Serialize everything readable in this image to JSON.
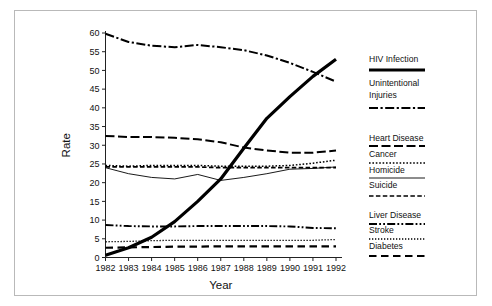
{
  "chart_data": {
    "type": "line",
    "title": "",
    "xlabel": "Year",
    "ylabel": "Rate",
    "x": [
      1982,
      1983,
      1984,
      1985,
      1986,
      1987,
      1988,
      1989,
      1990,
      1991,
      1992
    ],
    "categories": [
      "1982",
      "1983",
      "1984",
      "1985",
      "1986",
      "1987",
      "1988",
      "1989",
      "1990",
      "1991",
      "1992"
    ],
    "xlim": [
      1982,
      1992
    ],
    "ylim": [
      0,
      60
    ],
    "yticks": [
      0,
      5,
      10,
      15,
      20,
      25,
      30,
      35,
      40,
      45,
      50,
      55,
      60
    ],
    "ytick_labels": [
      "0",
      "5",
      "10",
      "15",
      "20",
      "25",
      "30",
      "35",
      "40",
      "45",
      "50",
      "55",
      "60"
    ],
    "grid": false,
    "legend_position": "right",
    "series": [
      {
        "name": "HIV Infection",
        "style": "solid-thick",
        "values": [
          0.6,
          2.6,
          5.4,
          9.6,
          15.0,
          21.0,
          29.2,
          37.2,
          43.0,
          48.4,
          53.0
        ]
      },
      {
        "name": "Unintentional Injuries",
        "style": "dash-dot",
        "values": [
          59.8,
          57.6,
          56.6,
          56.2,
          56.8,
          56.2,
          55.4,
          54.0,
          52.0,
          49.6,
          47.0
        ]
      },
      {
        "name": "Heart Disease",
        "style": "dashed-medium",
        "values": [
          32.5,
          32.2,
          32.2,
          32.0,
          31.6,
          30.8,
          29.4,
          28.6,
          28.0,
          28.0,
          28.6
        ]
      },
      {
        "name": "Cancer",
        "style": "dotted",
        "values": [
          24.6,
          24.4,
          24.6,
          24.6,
          24.6,
          24.4,
          24.4,
          24.4,
          24.6,
          25.2,
          26.0
        ]
      },
      {
        "name": "Homicide",
        "style": "thin-solid",
        "values": [
          24.0,
          22.4,
          21.4,
          21.0,
          22.2,
          20.6,
          21.4,
          22.4,
          23.6,
          23.8,
          24.2
        ]
      },
      {
        "name": "Suicide",
        "style": "dashed-short",
        "values": [
          24.2,
          24.2,
          24.2,
          24.2,
          24.2,
          24.0,
          24.0,
          24.0,
          24.0,
          24.0,
          24.0
        ]
      },
      {
        "name": "Liver Disease",
        "style": "dash-dot-dot",
        "values": [
          8.7,
          8.4,
          8.3,
          8.3,
          8.4,
          8.4,
          8.4,
          8.4,
          8.3,
          7.9,
          7.8
        ]
      },
      {
        "name": "Stroke",
        "style": "fine-dotted",
        "values": [
          4.2,
          4.3,
          4.5,
          4.6,
          4.6,
          4.6,
          4.6,
          4.6,
          4.6,
          4.6,
          4.8
        ]
      },
      {
        "name": "Diabetes",
        "style": "long-dash",
        "values": [
          2.6,
          2.7,
          2.8,
          2.9,
          2.9,
          3.0,
          3.0,
          3.0,
          3.0,
          3.0,
          3.0
        ]
      }
    ]
  },
  "legend": {
    "entries": [
      {
        "label": "HIV Infection",
        "style": "solid-thick"
      },
      {
        "label": "Unintentional",
        "label2": "Injuries",
        "style": "dash-dot"
      },
      {
        "label": "Heart Disease",
        "style": "dashed-medium"
      },
      {
        "label": "Cancer",
        "style": "dotted"
      },
      {
        "label": "Homicide",
        "style": "thin-solid"
      },
      {
        "label": "Suicide",
        "style": "dashed-short"
      },
      {
        "label": "Liver Disease",
        "style": "dash-dot-dot"
      },
      {
        "label": "Stroke",
        "style": "fine-dotted"
      },
      {
        "label": "Diabetes",
        "style": "long-dash"
      }
    ]
  },
  "colors": {
    "line": "#000000",
    "axis": "#222222",
    "frame": "#b9b9b9",
    "background": "#ffffff"
  }
}
